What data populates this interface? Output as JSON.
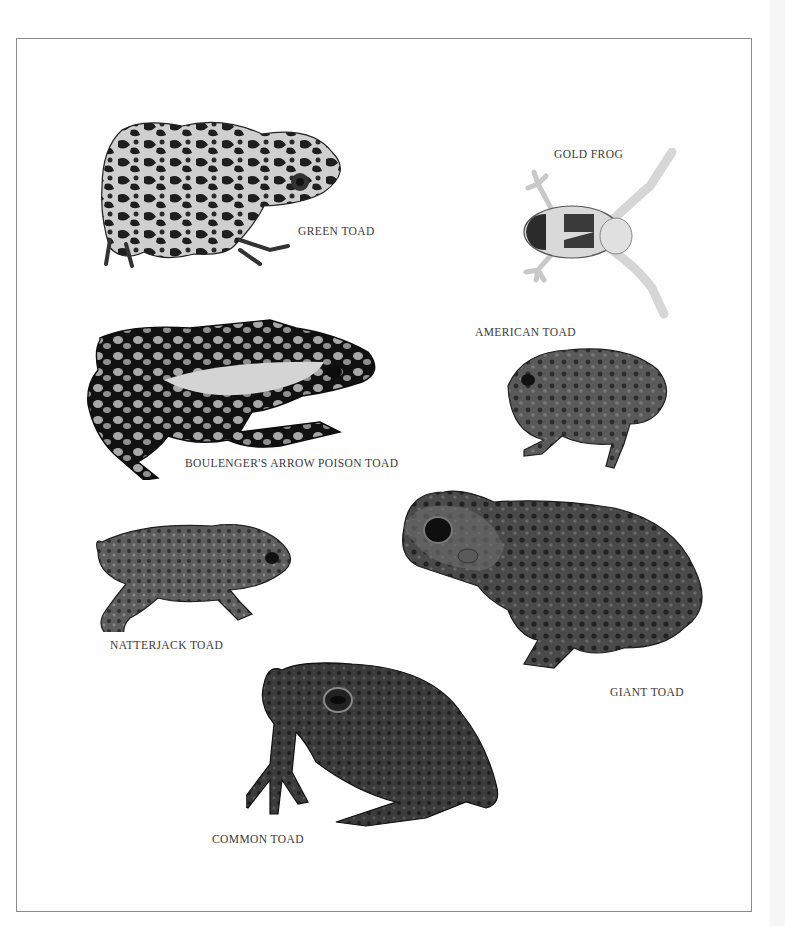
{
  "plate": {
    "border_color": "#8a8a8a",
    "background": "#fefefe"
  },
  "specimens": [
    {
      "id": "green-toad",
      "label": "GREEN TOAD"
    },
    {
      "id": "gold-frog",
      "label": "GOLD FROG"
    },
    {
      "id": "american-toad",
      "label": "AMERICAN TOAD"
    },
    {
      "id": "boulengers-arrow-poison-toad",
      "label": "BOULENGER'S ARROW POISON TOAD"
    },
    {
      "id": "natterjack-toad",
      "label": "NATTERJACK TOAD"
    },
    {
      "id": "giant-toad",
      "label": "GIANT TOAD"
    },
    {
      "id": "common-toad",
      "label": "COMMON TOAD"
    }
  ]
}
